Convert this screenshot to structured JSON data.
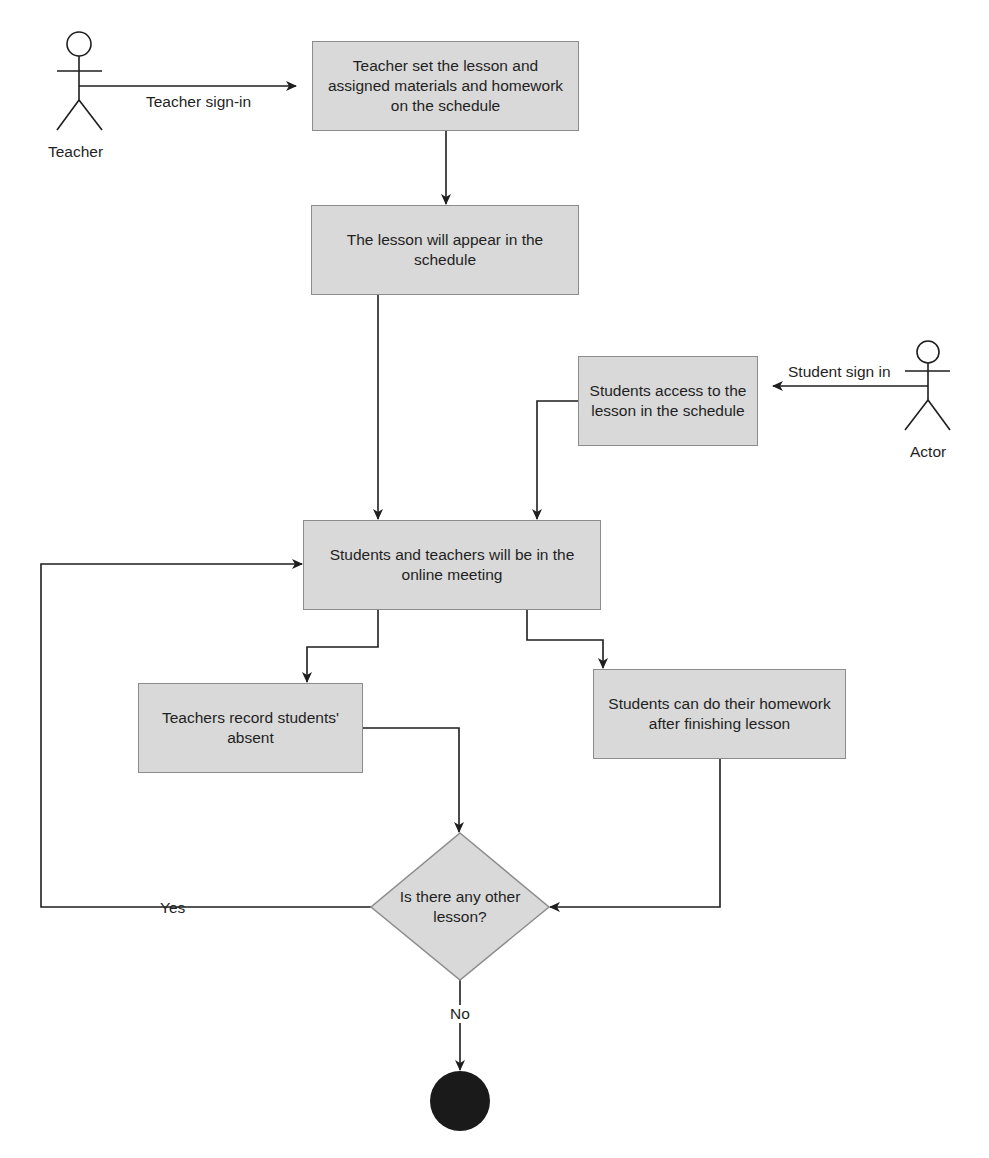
{
  "diagram": {
    "type": "activity-flowchart",
    "actors": [
      {
        "id": "teacher",
        "label": "Teacher"
      },
      {
        "id": "student",
        "label": "Actor"
      }
    ],
    "nodes": [
      {
        "id": "n1",
        "shape": "rect",
        "text": "Teacher set the lesson and assigned materials and homework on the schedule"
      },
      {
        "id": "n2",
        "shape": "rect",
        "text": "The lesson will appear in the schedule"
      },
      {
        "id": "n3",
        "shape": "rect",
        "text": "Students access to the lesson in the schedule"
      },
      {
        "id": "n4",
        "shape": "rect",
        "text": "Students and teachers will be in the online meeting"
      },
      {
        "id": "n5",
        "shape": "rect",
        "text": "Teachers record students' absent"
      },
      {
        "id": "n6",
        "shape": "rect",
        "text": "Students can do their homework after finishing lesson"
      },
      {
        "id": "d1",
        "shape": "diamond",
        "text": "Is there any other lesson?"
      },
      {
        "id": "end",
        "shape": "final-node",
        "text": ""
      }
    ],
    "edges": [
      {
        "from": "teacher",
        "to": "n1",
        "label": "Teacher sign-in"
      },
      {
        "from": "n1",
        "to": "n2",
        "label": ""
      },
      {
        "from": "n2",
        "to": "n4",
        "label": ""
      },
      {
        "from": "student",
        "to": "n3",
        "label": "Student sign in"
      },
      {
        "from": "n3",
        "to": "n4",
        "label": ""
      },
      {
        "from": "n4",
        "to": "n5",
        "label": ""
      },
      {
        "from": "n4",
        "to": "n6",
        "label": ""
      },
      {
        "from": "n5",
        "to": "d1",
        "label": ""
      },
      {
        "from": "n6",
        "to": "d1",
        "label": ""
      },
      {
        "from": "d1",
        "to": "n4",
        "label": "Yes"
      },
      {
        "from": "d1",
        "to": "end",
        "label": "No"
      }
    ],
    "labels": {
      "teacher_actor": "Teacher",
      "student_actor": "Actor",
      "teacher_signin": "Teacher sign-in",
      "student_signin": "Student sign in",
      "yes": "Yes",
      "no": "No"
    },
    "node_text": {
      "n1": "Teacher set the lesson and assigned materials and homework on the schedule",
      "n2": "The lesson will appear in the schedule",
      "n3": "Students access to the lesson in the schedule",
      "n4": "Students and teachers will be in the online meeting",
      "n5": "Teachers record students' absent",
      "n6": "Students can do their homework after finishing lesson",
      "d1": "Is there any other lesson?"
    },
    "colors": {
      "node_fill": "#d9d9d9",
      "node_border": "#8c8c8c",
      "line": "#1e1e1e",
      "end_node": "#1a1a1a",
      "background": "#ffffff"
    }
  }
}
